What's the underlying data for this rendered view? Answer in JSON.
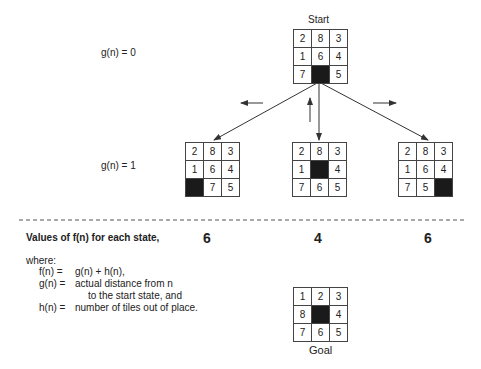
{
  "start": {
    "label": "Start",
    "g_label": "g(n) = 0",
    "tiles": [
      "2",
      "8",
      "3",
      "1",
      "6",
      "4",
      "7",
      "",
      "5"
    ]
  },
  "level1": {
    "g_label": "g(n) = 1",
    "states": [
      {
        "tiles": [
          "2",
          "8",
          "3",
          "1",
          "6",
          "4",
          "",
          "7",
          "5"
        ],
        "f": "6"
      },
      {
        "tiles": [
          "2",
          "8",
          "3",
          "1",
          "",
          "4",
          "7",
          "6",
          "5"
        ],
        "f": "4"
      },
      {
        "tiles": [
          "2",
          "8",
          "3",
          "1",
          "6",
          "4",
          "7",
          "5",
          ""
        ],
        "f": "6"
      }
    ]
  },
  "legend": {
    "title": "Values of f(n) for each state,",
    "where": "where:",
    "lines": [
      {
        "lhs": "f(n) =",
        "rhs": "g(n)  +  h(n),"
      },
      {
        "lhs": "g(n) =",
        "rhs": "actual distance from n"
      },
      {
        "lhs": "",
        "rhs": "to the start state, and"
      },
      {
        "lhs": "h(n) =",
        "rhs": "number of tiles out of place."
      }
    ]
  },
  "goal": {
    "label": "Goal",
    "tiles": [
      "1",
      "2",
      "3",
      "8",
      "",
      "4",
      "7",
      "6",
      "5"
    ]
  }
}
